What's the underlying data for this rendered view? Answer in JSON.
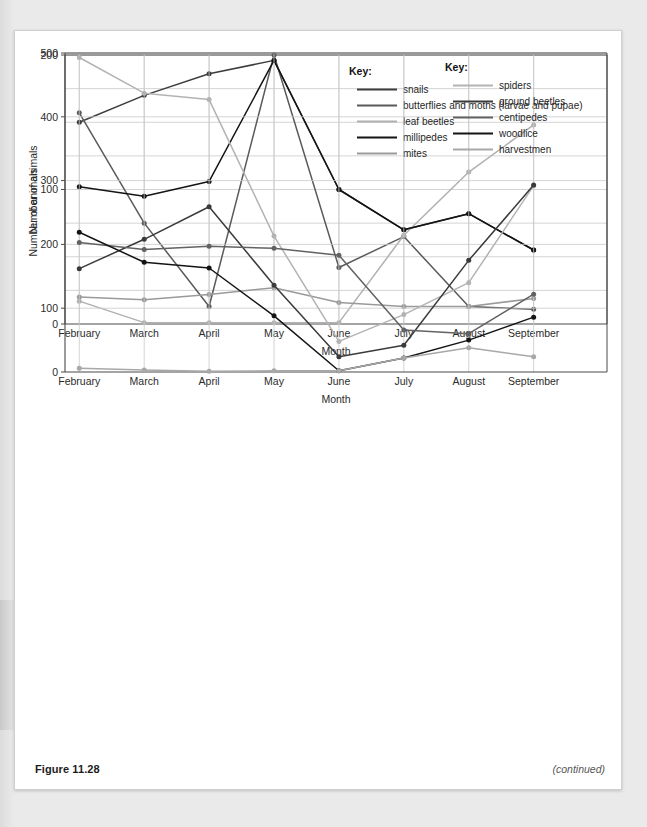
{
  "figure": {
    "number_label": "Figure 11.28",
    "continued_label": "(continued)"
  },
  "colors": {
    "ink": "#2b2b2b",
    "grid": "#c9c9c9",
    "axis": "#4a4a4a",
    "card": "#ffffff",
    "page": "#eaeaea",
    "snails": "#3d3d3d",
    "butterflies": "#5a5a5a",
    "leaf_beetles": "#b0b0b0",
    "millipedes": "#141414",
    "mites": "#9a9a9a",
    "spiders": "#b3b3b3",
    "ground_beetles": "#3a3a3a",
    "centipedes": "#626262",
    "woodlice": "#141414",
    "harvestmen": "#a8a8a8"
  },
  "chart_data": [
    {
      "id": "upper-chart",
      "type": "line",
      "title": "",
      "xlabel": "Month",
      "ylabel": "Number of animals",
      "categories": [
        "February",
        "March",
        "April",
        "May",
        "June",
        "July",
        "August",
        "September"
      ],
      "ylim": [
        0,
        200
      ],
      "ytick_labels": [
        "0",
        "100",
        "200"
      ],
      "yticks": [
        0,
        100,
        200
      ],
      "gridline_step": 25,
      "grid": true,
      "legend_position": "inside-top-right",
      "legend_title": "Key:",
      "series": [
        {
          "name": "snails",
          "color_key": "snails",
          "values": [
            150,
            170,
            186,
            196,
            100,
            70,
            82,
            55
          ]
        },
        {
          "name": "butterflies and moths (larvae and pupae)",
          "color_key": "butterflies",
          "values": [
            157,
            75,
            13,
            200,
            42,
            65,
            13,
            11
          ]
        },
        {
          "name": "leaf beetles",
          "color_key": "leaf_beetles",
          "values": [
            17,
            1,
            1,
            1,
            1,
            66,
            113,
            148
          ]
        },
        {
          "name": "millipedes",
          "color_key": "millipedes",
          "values": [
            102,
            95,
            106,
            196,
            100,
            70,
            82,
            55
          ]
        },
        {
          "name": "mites",
          "color_key": "mites",
          "values": [
            20,
            18,
            22,
            27,
            16,
            13,
            13,
            19
          ]
        }
      ]
    },
    {
      "id": "lower-chart",
      "type": "line",
      "title": "",
      "xlabel": "Month",
      "ylabel": "Number of animals",
      "categories": [
        "February",
        "March",
        "April",
        "May",
        "June",
        "July",
        "August",
        "September"
      ],
      "ylim": [
        0,
        500
      ],
      "ytick_labels": [
        "0",
        "100",
        "200",
        "300",
        "400",
        "500"
      ],
      "yticks": [
        0,
        100,
        200,
        300,
        400,
        500
      ],
      "gridline_step": 100,
      "grid": true,
      "legend_position": "inside-top-right",
      "legend_title": "Key:",
      "series": [
        {
          "name": "spiders",
          "color_key": "spiders",
          "values": [
            493,
            437,
            427,
            213,
            48,
            90,
            140,
            292
          ]
        },
        {
          "name": "ground beetles",
          "color_key": "ground_beetles",
          "values": [
            162,
            208,
            259,
            136,
            24,
            42,
            175,
            293
          ]
        },
        {
          "name": "centipedes",
          "color_key": "centipedes",
          "values": [
            203,
            192,
            197,
            194,
            183,
            66,
            60,
            122
          ]
        },
        {
          "name": "woodlice",
          "color_key": "woodlice",
          "values": [
            219,
            172,
            163,
            88,
            2,
            22,
            50,
            86
          ]
        },
        {
          "name": "harvestmen",
          "color_key": "harvestmen",
          "values": [
            6,
            3,
            1,
            2,
            2,
            22,
            38,
            24
          ]
        }
      ]
    }
  ]
}
